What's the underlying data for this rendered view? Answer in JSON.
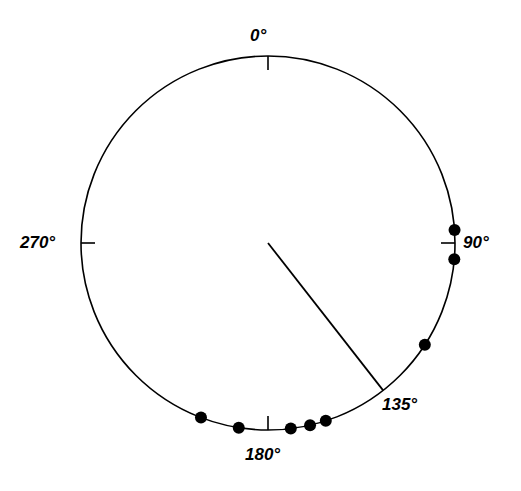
{
  "figure": {
    "type": "circular-plot",
    "background_color": "#ffffff",
    "stroke_color": "#000000",
    "point_color": "#000000"
  },
  "chart_data": {
    "type": "scatter",
    "subtype": "circular-polar-scatter",
    "title": "",
    "subtitle": "",
    "xlabel": "",
    "ylabel": "",
    "grid": false,
    "legend_position": "none",
    "angle_unit": "degrees",
    "angle_zero_at": "top",
    "angle_direction": "clockwise",
    "axis_range_deg": [
      0,
      360
    ],
    "tick_labels": [
      "0°",
      "90°",
      "135°",
      "180°",
      "270°"
    ],
    "tick_values_deg": [
      0,
      90,
      135,
      180,
      270
    ],
    "tick_label_texts": {
      "t0": "0°",
      "t90": "90°",
      "t135": "135°",
      "t180": "180°",
      "t270": "270°"
    },
    "ticks_drawn_deg": [
      0,
      90,
      180,
      270
    ],
    "series": [
      {
        "name": "observations",
        "marker": "filled-circle",
        "marker_radius_px": 6,
        "values_deg": [
          86,
          95,
          123,
          162,
          167,
          173,
          189,
          201
        ],
        "count": 8
      }
    ],
    "mean_vector": {
      "name": "mean-direction",
      "angle_deg": 142,
      "length_fraction": 1.0,
      "drawn_as": "radius-line-from-center-to-perimeter"
    },
    "annotations": []
  },
  "geometry": {
    "center_x": 268,
    "center_y": 243,
    "radius": 187,
    "tick_length": 14,
    "circle_stroke_width": 1.6
  }
}
